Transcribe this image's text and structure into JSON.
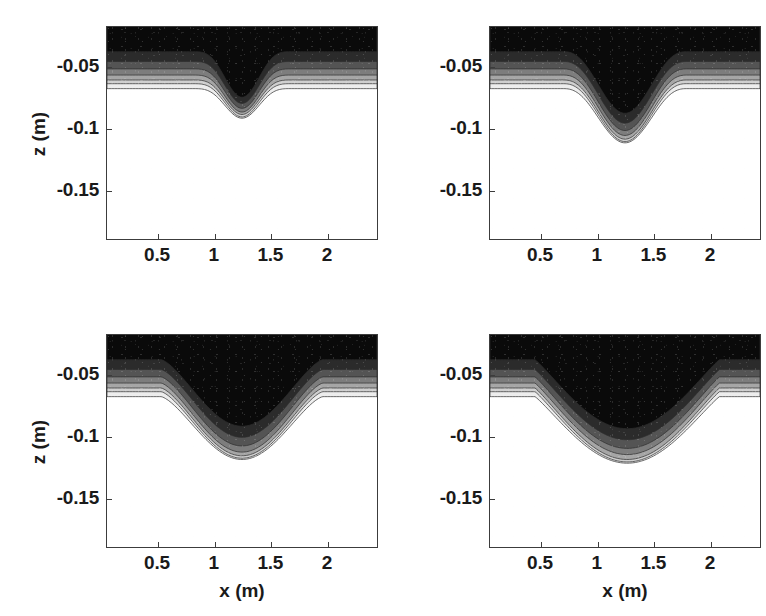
{
  "figure": {
    "kind": "contour-panel-grid",
    "rows": 2,
    "cols": 2,
    "background": "#ffffff",
    "axis_color": "#3c3c3c"
  },
  "axes_common": {
    "xlabel": "x (m)",
    "ylabel": "z (m)",
    "xticks": [
      0.5,
      1,
      1.5,
      2
    ],
    "xticklabels": [
      "0.5",
      "1",
      "1.5",
      "2"
    ],
    "yticks": [
      -0.05,
      -0.1,
      -0.15
    ],
    "yticklabels": [
      "-0.05",
      "-0.1",
      "-0.15"
    ],
    "xlim": [
      0.05,
      2.45
    ],
    "ylim": [
      -0.19,
      -0.018
    ],
    "grid": false,
    "legend": false
  },
  "colormap": {
    "name": "gray",
    "levels": 7,
    "bands": [
      {
        "index": 0,
        "hex": "#0a0a0a",
        "label": "deepest sediment concentration"
      },
      {
        "index": 1,
        "hex": "#2b2b2b",
        "label": ""
      },
      {
        "index": 2,
        "hex": "#545454",
        "label": ""
      },
      {
        "index": 3,
        "hex": "#7d7d7d",
        "label": ""
      },
      {
        "index": 4,
        "hex": "#a6a6a6",
        "label": ""
      },
      {
        "index": 5,
        "hex": "#cfcfcf",
        "label": ""
      },
      {
        "index": 6,
        "hex": "#ededed",
        "label": ""
      },
      {
        "index": 7,
        "hex": "#ffffff",
        "label": "clear water / no sediment"
      }
    ]
  },
  "chart_data": {
    "type": "area",
    "title": "",
    "subtitle": "",
    "xlabel": "x (m)",
    "ylabel": "z (m)",
    "xlim": [
      0.05,
      2.45
    ],
    "ylim": [
      -0.19,
      -0.018
    ],
    "grid": false,
    "legend_position": "none",
    "panels": [
      {
        "id": "panel-top-left",
        "position": "top-left",
        "shows_xlabel": false,
        "shows_ylabel": true,
        "scour": {
          "center_x": 1.25,
          "min_bed_z": -0.092,
          "flat_bed_z": -0.068,
          "half_width": 0.45,
          "shape": "narrow V",
          "max_depth_below_flat": 0.024
        },
        "contour_levels": [
          {
            "index": 0,
            "hex": "#0a0a0a",
            "flat_z": -0.038,
            "min_z": -0.075
          },
          {
            "index": 1,
            "hex": "#2b2b2b",
            "flat_z": -0.046,
            "min_z": -0.08
          },
          {
            "index": 2,
            "hex": "#545454",
            "flat_z": -0.052,
            "min_z": -0.084
          },
          {
            "index": 3,
            "hex": "#7d7d7d",
            "flat_z": -0.057,
            "min_z": -0.087
          },
          {
            "index": 4,
            "hex": "#a6a6a6",
            "flat_z": -0.061,
            "min_z": -0.089
          },
          {
            "index": 5,
            "hex": "#cfcfcf",
            "flat_z": -0.064,
            "min_z": -0.091
          },
          {
            "index": 6,
            "hex": "#ededed",
            "flat_z": -0.068,
            "min_z": -0.092
          }
        ]
      },
      {
        "id": "panel-top-right",
        "position": "top-right",
        "shows_xlabel": false,
        "shows_ylabel": false,
        "scour": {
          "center_x": 1.25,
          "min_bed_z": -0.112,
          "flat_bed_z": -0.068,
          "half_width": 0.55,
          "shape": "rounded U",
          "max_depth_below_flat": 0.044
        },
        "contour_levels": [
          {
            "index": 0,
            "hex": "#0a0a0a",
            "flat_z": -0.038,
            "min_z": -0.088
          },
          {
            "index": 1,
            "hex": "#2b2b2b",
            "flat_z": -0.046,
            "min_z": -0.096
          },
          {
            "index": 2,
            "hex": "#545454",
            "flat_z": -0.052,
            "min_z": -0.102
          },
          {
            "index": 3,
            "hex": "#7d7d7d",
            "flat_z": -0.057,
            "min_z": -0.106
          },
          {
            "index": 4,
            "hex": "#a6a6a6",
            "flat_z": -0.061,
            "min_z": -0.109
          },
          {
            "index": 5,
            "hex": "#cfcfcf",
            "flat_z": -0.064,
            "min_z": -0.111
          },
          {
            "index": 6,
            "hex": "#ededed",
            "flat_z": -0.068,
            "min_z": -0.112
          }
        ]
      },
      {
        "id": "panel-bottom-left",
        "position": "bottom-left",
        "shows_xlabel": true,
        "shows_ylabel": true,
        "scour": {
          "center_x": 1.25,
          "min_bed_z": -0.119,
          "flat_bed_z": -0.068,
          "half_width": 0.72,
          "shape": "wide flat-bottomed U",
          "max_depth_below_flat": 0.051
        },
        "contour_levels": [
          {
            "index": 0,
            "hex": "#0a0a0a",
            "flat_z": -0.038,
            "min_z": -0.092
          },
          {
            "index": 1,
            "hex": "#2b2b2b",
            "flat_z": -0.046,
            "min_z": -0.101
          },
          {
            "index": 2,
            "hex": "#545454",
            "flat_z": -0.052,
            "min_z": -0.108
          },
          {
            "index": 3,
            "hex": "#7d7d7d",
            "flat_z": -0.057,
            "min_z": -0.113
          },
          {
            "index": 4,
            "hex": "#a6a6a6",
            "flat_z": -0.061,
            "min_z": -0.116
          },
          {
            "index": 5,
            "hex": "#cfcfcf",
            "flat_z": -0.064,
            "min_z": -0.118
          },
          {
            "index": 6,
            "hex": "#ededed",
            "flat_z": -0.068,
            "min_z": -0.119
          }
        ]
      },
      {
        "id": "panel-bottom-right",
        "position": "bottom-right",
        "shows_xlabel": true,
        "shows_ylabel": false,
        "scour": {
          "center_x": 1.27,
          "min_bed_z": -0.122,
          "flat_bed_z": -0.068,
          "half_width": 0.82,
          "shape": "widest flat-bottomed U",
          "max_depth_below_flat": 0.054
        },
        "contour_levels": [
          {
            "index": 0,
            "hex": "#0a0a0a",
            "flat_z": -0.038,
            "min_z": -0.094
          },
          {
            "index": 1,
            "hex": "#2b2b2b",
            "flat_z": -0.046,
            "min_z": -0.103
          },
          {
            "index": 2,
            "hex": "#545454",
            "flat_z": -0.052,
            "min_z": -0.11
          },
          {
            "index": 3,
            "hex": "#7d7d7d",
            "flat_z": -0.057,
            "min_z": -0.115
          },
          {
            "index": 4,
            "hex": "#a6a6a6",
            "flat_z": -0.061,
            "min_z": -0.119
          },
          {
            "index": 5,
            "hex": "#cfcfcf",
            "flat_z": -0.064,
            "min_z": -0.121
          },
          {
            "index": 6,
            "hex": "#ededed",
            "flat_z": -0.068,
            "min_z": -0.122
          }
        ]
      }
    ]
  }
}
